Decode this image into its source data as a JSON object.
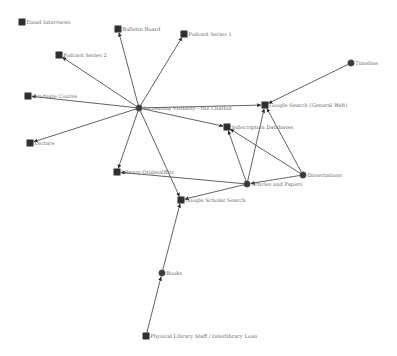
{
  "graph": {
    "type": "network",
    "nodes": [
      {
        "id": "email",
        "label": "Email Interviews",
        "shape": "square",
        "x": 22,
        "y": 22
      },
      {
        "id": "bulletin",
        "label": "Bulletin Board",
        "shape": "square",
        "x": 118,
        "y": 29
      },
      {
        "id": "podcast1",
        "label": "Podcast Series 1",
        "shape": "square",
        "x": 184,
        "y": 34
      },
      {
        "id": "podcast2",
        "label": "Podcast Series 2",
        "shape": "square",
        "x": 59,
        "y": 55
      },
      {
        "id": "grad",
        "label": "Graduate Course",
        "shape": "square",
        "x": 28,
        "y": 96
      },
      {
        "id": "lecture",
        "label": "Lecture",
        "shape": "square",
        "x": 30,
        "y": 143
      },
      {
        "id": "hub",
        "label": "Increasing Visibility - the Chatbot",
        "shape": "circle",
        "x": 139,
        "y": 108
      },
      {
        "id": "google",
        "label": "Google Search (General Web)",
        "shape": "square",
        "x": 265,
        "y": 105
      },
      {
        "id": "timeline",
        "label": "Timeline",
        "shape": "circle",
        "x": 351,
        "y": 63
      },
      {
        "id": "subdb",
        "label": "Subscription Databases",
        "shape": "square",
        "x": 227,
        "y": 127
      },
      {
        "id": "diss",
        "label": "Dissertations",
        "shape": "circle",
        "x": 303,
        "y": 175
      },
      {
        "id": "articles",
        "label": "Articles and Papers",
        "shape": "circle",
        "x": 247,
        "y": 184
      },
      {
        "id": "library",
        "label": "Library OriginalBits",
        "shape": "square",
        "x": 117,
        "y": 172
      },
      {
        "id": "scholar",
        "label": "Google Scholar Search",
        "shape": "square",
        "x": 181,
        "y": 200
      },
      {
        "id": "books",
        "label": "Books",
        "shape": "circle",
        "x": 162,
        "y": 273
      },
      {
        "id": "staff",
        "label": "Physical Library Staff / Interlibrary Loan",
        "shape": "square",
        "x": 146,
        "y": 336
      }
    ],
    "edges": [
      {
        "from": "hub",
        "to": "bulletin"
      },
      {
        "from": "hub",
        "to": "podcast1"
      },
      {
        "from": "hub",
        "to": "podcast2"
      },
      {
        "from": "hub",
        "to": "grad"
      },
      {
        "from": "hub",
        "to": "lecture"
      },
      {
        "from": "hub",
        "to": "google"
      },
      {
        "from": "hub",
        "to": "subdb"
      },
      {
        "from": "hub",
        "to": "library"
      },
      {
        "from": "hub",
        "to": "scholar"
      },
      {
        "from": "timeline",
        "to": "google"
      },
      {
        "from": "articles",
        "to": "google"
      },
      {
        "from": "articles",
        "to": "subdb"
      },
      {
        "from": "diss",
        "to": "google"
      },
      {
        "from": "diss",
        "to": "subdb"
      },
      {
        "from": "diss",
        "to": "articles"
      },
      {
        "from": "articles",
        "to": "library"
      },
      {
        "from": "articles",
        "to": "scholar"
      },
      {
        "from": "books",
        "to": "scholar"
      },
      {
        "from": "staff",
        "to": "books"
      }
    ]
  }
}
